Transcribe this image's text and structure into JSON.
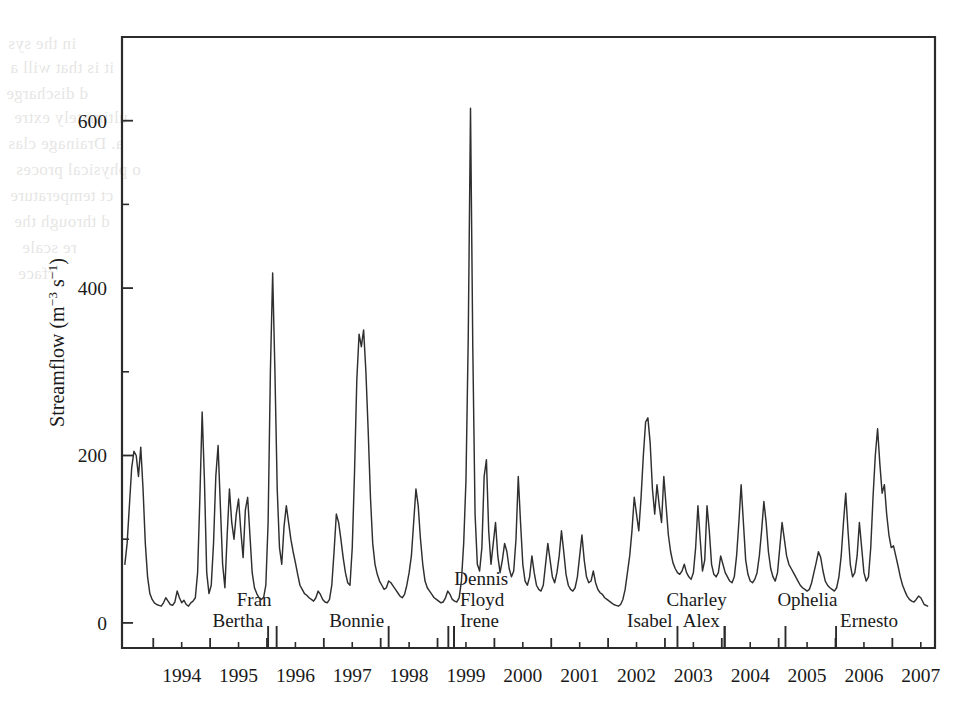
{
  "figure": {
    "background": "#ffffff",
    "ink_color": "#2b2b2b",
    "bleed_through_text": [
      "in the sys",
      "it is that will a",
      "d discharge",
      "ultimately extre",
      "a. Drainage clas",
      "o physical proces",
      "ct temperature",
      "d through the",
      "re scale",
      "rface"
    ]
  },
  "chart_data": {
    "type": "line",
    "title": "",
    "xlabel": "",
    "ylabel": "Streamflow (m−3 s−1)",
    "ylabel_parts": {
      "prefix": "Streamflow (m",
      "sup1": "−3",
      "mid": " s",
      "sup2": "−1",
      "suffix": ")"
    },
    "xlim": [
      1993.45,
      2007.75
    ],
    "ylim": [
      -30,
      700
    ],
    "grid": false,
    "legend": "none",
    "x_major_ticks": [
      1994,
      1995,
      1996,
      1997,
      1998,
      1999,
      2000,
      2001,
      2002,
      2003,
      2004,
      2005,
      2006,
      2007
    ],
    "x_tick_labels": [
      "1994",
      "1995",
      "1996",
      "1997",
      "1998",
      "1999",
      "2000",
      "2001",
      "2002",
      "2003",
      "2004",
      "2005",
      "2006",
      "2007"
    ],
    "y_major_ticks": [
      0,
      200,
      400,
      600
    ],
    "y_tick_labels": [
      "0",
      "200",
      "400",
      "600"
    ],
    "y_minor_ticks": [
      100,
      300,
      500
    ],
    "series_name": "Streamflow",
    "x": [
      1993.5,
      1993.54,
      1993.58,
      1993.62,
      1993.66,
      1993.7,
      1993.74,
      1993.78,
      1993.82,
      1993.86,
      1993.9,
      1993.94,
      1993.98,
      1994.02,
      1994.06,
      1994.1,
      1994.14,
      1994.18,
      1994.22,
      1994.26,
      1994.3,
      1994.34,
      1994.38,
      1994.42,
      1994.46,
      1994.5,
      1994.54,
      1994.58,
      1994.62,
      1994.66,
      1994.7,
      1994.74,
      1994.78,
      1994.82,
      1994.86,
      1994.9,
      1994.94,
      1994.98,
      1995.02,
      1995.06,
      1995.1,
      1995.14,
      1995.18,
      1995.22,
      1995.26,
      1995.3,
      1995.34,
      1995.38,
      1995.42,
      1995.46,
      1995.5,
      1995.54,
      1995.58,
      1995.62,
      1995.66,
      1995.7,
      1995.74,
      1995.78,
      1995.82,
      1995.86,
      1995.9,
      1995.94,
      1995.98,
      1996.02,
      1996.06,
      1996.1,
      1996.14,
      1996.18,
      1996.22,
      1996.26,
      1996.3,
      1996.34,
      1996.38,
      1996.42,
      1996.46,
      1996.5,
      1996.54,
      1996.58,
      1996.62,
      1996.66,
      1996.7,
      1996.74,
      1996.78,
      1996.82,
      1996.86,
      1996.9,
      1996.94,
      1996.98,
      1997.02,
      1997.06,
      1997.1,
      1997.14,
      1997.18,
      1997.22,
      1997.26,
      1997.3,
      1997.34,
      1997.38,
      1997.42,
      1997.46,
      1997.5,
      1997.54,
      1997.58,
      1997.62,
      1997.66,
      1997.7,
      1997.74,
      1997.78,
      1997.82,
      1997.86,
      1997.9,
      1997.94,
      1997.98,
      1998.02,
      1998.06,
      1998.1,
      1998.14,
      1998.18,
      1998.22,
      1998.26,
      1998.3,
      1998.34,
      1998.38,
      1998.42,
      1998.46,
      1998.5,
      1998.54,
      1998.58,
      1998.62,
      1998.66,
      1998.7,
      1998.74,
      1998.78,
      1998.82,
      1998.86,
      1998.9,
      1998.94,
      1998.98,
      1999.02,
      1999.06,
      1999.1,
      1999.14,
      1999.18,
      1999.22,
      1999.26,
      1999.3,
      1999.34,
      1999.38,
      1999.42,
      1999.46,
      1999.5,
      1999.54,
      1999.58,
      1999.62,
      1999.66,
      1999.7,
      1999.74,
      1999.78,
      1999.82,
      1999.86,
      1999.9,
      1999.94,
      1999.98,
      2000.02,
      2000.06,
      2000.1,
      2000.14,
      2000.18,
      2000.22,
      2000.26,
      2000.3,
      2000.34,
      2000.38,
      2000.42,
      2000.46,
      2000.5,
      2000.54,
      2000.58,
      2000.62,
      2000.66,
      2000.7,
      2000.74,
      2000.78,
      2000.82,
      2000.86,
      2000.9,
      2000.94,
      2000.98,
      2001.02,
      2001.06,
      2001.1,
      2001.14,
      2001.18,
      2001.22,
      2001.26,
      2001.3,
      2001.34,
      2001.38,
      2001.42,
      2001.46,
      2001.5,
      2001.54,
      2001.58,
      2001.62,
      2001.66,
      2001.7,
      2001.74,
      2001.78,
      2001.82,
      2001.86,
      2001.9,
      2001.94,
      2001.98,
      2002.02,
      2002.06,
      2002.1,
      2002.14,
      2002.18,
      2002.22,
      2002.26,
      2002.3,
      2002.34,
      2002.38,
      2002.42,
      2002.46,
      2002.5,
      2002.54,
      2002.58,
      2002.62,
      2002.66,
      2002.7,
      2002.74,
      2002.78,
      2002.82,
      2002.86,
      2002.9,
      2002.94,
      2002.98,
      2003.02,
      2003.06,
      2003.1,
      2003.14,
      2003.18,
      2003.22,
      2003.26,
      2003.3,
      2003.34,
      2003.38,
      2003.42,
      2003.46,
      2003.5,
      2003.54,
      2003.58,
      2003.62,
      2003.66,
      2003.7,
      2003.74,
      2003.78,
      2003.82,
      2003.86,
      2003.9,
      2003.94,
      2003.98,
      2004.02,
      2004.06,
      2004.1,
      2004.14,
      2004.18,
      2004.22,
      2004.26,
      2004.3,
      2004.34,
      2004.38,
      2004.42,
      2004.46,
      2004.5,
      2004.54,
      2004.58,
      2004.62,
      2004.66,
      2004.7,
      2004.74,
      2004.78,
      2004.82,
      2004.86,
      2004.9,
      2004.94,
      2004.98,
      2005.02,
      2005.06,
      2005.1,
      2005.14,
      2005.18,
      2005.22,
      2005.26,
      2005.3,
      2005.34,
      2005.38,
      2005.42,
      2005.46,
      2005.5,
      2005.54,
      2005.58,
      2005.62,
      2005.66,
      2005.7,
      2005.74,
      2005.78,
      2005.82,
      2005.86,
      2005.9,
      2005.94,
      2005.98,
      2006.02,
      2006.06,
      2006.1,
      2006.14,
      2006.18,
      2006.22,
      2006.26,
      2006.3,
      2006.34,
      2006.38,
      2006.42,
      2006.46,
      2006.5,
      2006.54,
      2006.58,
      2006.62,
      2006.66,
      2006.7,
      2006.74,
      2006.78,
      2006.82,
      2006.86,
      2006.9,
      2006.94,
      2006.98,
      2007.02,
      2007.06,
      2007.1,
      2007.14,
      2007.18,
      2007.22,
      2007.26,
      2007.3,
      2007.34,
      2007.38,
      2007.42,
      2007.46,
      2007.5,
      2007.56,
      2007.62
    ],
    "y": [
      70,
      95,
      140,
      185,
      205,
      200,
      175,
      210,
      160,
      95,
      55,
      35,
      28,
      24,
      22,
      21,
      20,
      24,
      30,
      26,
      22,
      21,
      25,
      38,
      30,
      24,
      27,
      22,
      20,
      24,
      26,
      30,
      60,
      150,
      252,
      170,
      60,
      35,
      45,
      95,
      175,
      212,
      140,
      70,
      42,
      105,
      160,
      120,
      100,
      130,
      148,
      110,
      78,
      135,
      150,
      105,
      60,
      42,
      35,
      30,
      28,
      30,
      45,
      120,
      300,
      418,
      300,
      160,
      90,
      70,
      115,
      140,
      120,
      100,
      85,
      72,
      58,
      45,
      40,
      35,
      33,
      30,
      28,
      26,
      30,
      38,
      34,
      28,
      25,
      24,
      28,
      45,
      85,
      130,
      120,
      100,
      78,
      60,
      48,
      45,
      90,
      180,
      290,
      345,
      330,
      350,
      300,
      230,
      150,
      95,
      70,
      58,
      50,
      45,
      40,
      42,
      50,
      48,
      44,
      40,
      36,
      32,
      30,
      34,
      45,
      60,
      80,
      120,
      160,
      140,
      100,
      70,
      50,
      42,
      38,
      34,
      30,
      28,
      26,
      24,
      25,
      30,
      38,
      34,
      28,
      26,
      25,
      30,
      50,
      95,
      170,
      340,
      615,
      330,
      130,
      70,
      62,
      90,
      175,
      195,
      110,
      70,
      95,
      120,
      80,
      60,
      75,
      95,
      85,
      65,
      55,
      62,
      100,
      175,
      120,
      70,
      50,
      45,
      55,
      80,
      60,
      45,
      40,
      38,
      45,
      70,
      95,
      75,
      55,
      48,
      60,
      80,
      110,
      85,
      58,
      45,
      40,
      38,
      42,
      55,
      80,
      105,
      75,
      55,
      48,
      50,
      62,
      48,
      40,
      36,
      34,
      30,
      28,
      26,
      24,
      22,
      21,
      20,
      22,
      28,
      40,
      60,
      80,
      110,
      150,
      130,
      110,
      150,
      200,
      240,
      245,
      215,
      160,
      130,
      165,
      140,
      120,
      175,
      140,
      105,
      85,
      72,
      65,
      60,
      58,
      62,
      70,
      60,
      55,
      52,
      60,
      90,
      140,
      100,
      62,
      75,
      140,
      110,
      70,
      58,
      55,
      60,
      80,
      70,
      60,
      55,
      50,
      48,
      55,
      80,
      120,
      165,
      120,
      75,
      58,
      50,
      48,
      52,
      60,
      80,
      110,
      145,
      120,
      85,
      65,
      55,
      50,
      60,
      90,
      120,
      100,
      80,
      70,
      65,
      60,
      55,
      50,
      45,
      42,
      40,
      38,
      40,
      48,
      60,
      72,
      85,
      78,
      62,
      50,
      45,
      42,
      40,
      38,
      42,
      55,
      80,
      120,
      155,
      110,
      70,
      55,
      60,
      80,
      120,
      90,
      60,
      50,
      55,
      90,
      150,
      200,
      232,
      190,
      155,
      165,
      130,
      105,
      90,
      92,
      80,
      68,
      55,
      45,
      38,
      32,
      28,
      26,
      25,
      28,
      32,
      30,
      22,
      20
    ],
    "annotations": [
      {
        "label": "Bertha",
        "x": 1996.02,
        "label_row": 1
      },
      {
        "label": "Fran",
        "x": 1996.17,
        "label_row": 0
      },
      {
        "label": "Bonnie",
        "x": 1998.14,
        "label_row": 1
      },
      {
        "label": "Dennis",
        "x": 1999.19,
        "label_row": -1
      },
      {
        "label": "Floyd",
        "x": 1999.29,
        "label_row": 0
      },
      {
        "label": "Irene",
        "x": 1999.29,
        "label_row": 1
      },
      {
        "label": "Isabel",
        "x": 2003.22,
        "label_row": 1
      },
      {
        "label": "Charley",
        "x": 2004.05,
        "label_row": 0
      },
      {
        "label": "Alex",
        "x": 2004.05,
        "label_row": 1
      },
      {
        "label": "Ophelia",
        "x": 2005.12,
        "label_row": 0
      },
      {
        "label": "Ernesto",
        "x": 2006.01,
        "label_row": 1
      }
    ]
  }
}
